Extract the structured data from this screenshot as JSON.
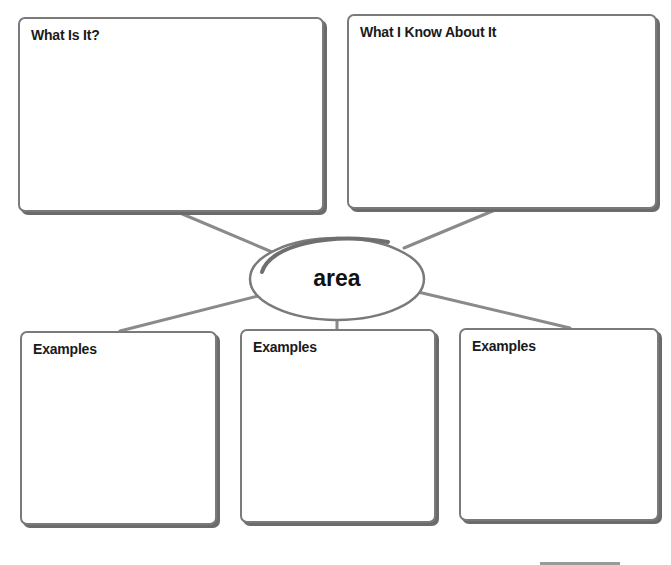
{
  "diagram": {
    "type": "concept-web",
    "center_term": "area",
    "boxes": [
      {
        "id": "what-is-it",
        "label": "What Is It?"
      },
      {
        "id": "what-i-know",
        "label": "What I Know About It"
      },
      {
        "id": "examples-1",
        "label": "Examples"
      },
      {
        "id": "examples-2",
        "label": "Examples"
      },
      {
        "id": "examples-3",
        "label": "Examples"
      }
    ],
    "colors": {
      "border": "#7a7a7a",
      "shadow": "#6b6b6b",
      "connector": "#8a8a8a",
      "text": "#1a1a1a",
      "background": "#ffffff"
    }
  }
}
